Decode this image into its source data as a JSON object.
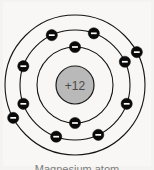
{
  "figure": {
    "caption": "Magnesium atom",
    "background_color": "#f4f3f1",
    "panel_color": "#f8f7f5"
  },
  "chart_data": {
    "type": "diagram",
    "subtype": "bohr-atom-model",
    "title": "Magnesium atom",
    "element_name": "Magnesium",
    "element_symbol": "Mg",
    "atomic_number": 12,
    "nucleus": {
      "label": "+12",
      "charge": 12,
      "center_x": 75,
      "center_y": 85,
      "radius": 19,
      "fill_color": "#b9b9b9",
      "stroke_color": "#1a1a1a",
      "text_color": "#4a4a4a"
    },
    "electron_style": {
      "symbol": "-",
      "fill_color": "#0a0a0a",
      "sign_color": "#ffffff",
      "radius": 5.6
    },
    "ring_style": {
      "stroke_color": "#141414",
      "stroke_width": 1.1
    },
    "shells": [
      {
        "name": "K",
        "index": 1,
        "radius": 38,
        "electron_count": 2,
        "electron_angles": [
          270,
          90
        ]
      },
      {
        "name": "L",
        "index": 2,
        "radius": 55,
        "electron_count": 8,
        "electron_angles": [
          250,
          200,
          160,
          115,
          70,
          25,
          340,
          295
        ]
      },
      {
        "name": "M",
        "index": 3,
        "radius": 70,
        "electron_count": 2,
        "electron_angles": [
          208,
          28
        ]
      }
    ],
    "total_electrons": 12,
    "electron_configuration": "2, 8, 2"
  }
}
